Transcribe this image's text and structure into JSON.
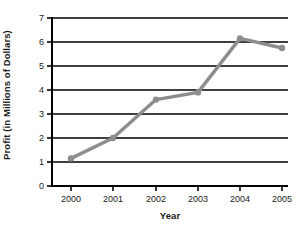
{
  "chart_data": {
    "type": "line",
    "title": "",
    "xlabel": "Year",
    "ylabel": "Profit (in Millions of Dollars)",
    "categories": [
      "2000",
      "2001",
      "2002",
      "2003",
      "2004",
      "2005"
    ],
    "x": [
      2000,
      2001,
      2002,
      2003,
      2004,
      2005
    ],
    "values": [
      1.15,
      2.0,
      3.6,
      3.9,
      6.15,
      5.75
    ],
    "series": [
      {
        "name": "Profit",
        "values": [
          1.15,
          2.0,
          3.6,
          3.9,
          6.15,
          5.75
        ]
      }
    ],
    "ylim": [
      0,
      7
    ],
    "yticks": [
      0,
      1,
      2,
      3,
      4,
      5,
      6,
      7
    ],
    "ytick_labels": [
      "0",
      "1",
      "2",
      "3",
      "4",
      "5",
      "6",
      "7"
    ],
    "xtick_labels": [
      "2000",
      "2001",
      "2002",
      "2003",
      "2004",
      "2005"
    ],
    "grid": "horizontal",
    "legend": "none",
    "line_color": "#8d8d8d",
    "marker_color": "#8d8d8d",
    "axis_color": "#000000",
    "grid_color": "#000000",
    "background": "#ffffff"
  },
  "axes": {
    "y_title": "Profit (in Millions of Dollars)",
    "x_title": "Year"
  },
  "yticks": {
    "t0": "0",
    "t1": "1",
    "t2": "2",
    "t3": "3",
    "t4": "4",
    "t5": "5",
    "t6": "6",
    "t7": "7"
  },
  "xticks": {
    "t0": "2000",
    "t1": "2001",
    "t2": "2002",
    "t3": "2003",
    "t4": "2004",
    "t5": "2005"
  }
}
